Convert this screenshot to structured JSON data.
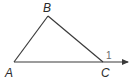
{
  "diagram": {
    "type": "triangle-exterior-angle",
    "vertices": [
      {
        "id": "A",
        "label": "A"
      },
      {
        "id": "B",
        "label": "B"
      },
      {
        "id": "C",
        "label": "C"
      }
    ],
    "segments": [
      {
        "from": "A",
        "to": "B"
      },
      {
        "from": "B",
        "to": "C"
      },
      {
        "from": "A",
        "to": "C"
      }
    ],
    "ray": {
      "from": "A",
      "through": "C",
      "arrow": true
    },
    "angle_label": {
      "at": "C",
      "label": "1",
      "kind": "exterior angle"
    },
    "colors": {
      "stroke": "#3a3a3a",
      "text": "#2b2b2b",
      "angle_text": "#6b6b6b"
    }
  }
}
